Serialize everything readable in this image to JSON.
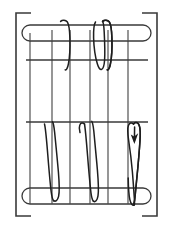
{
  "figure": {
    "width": 173,
    "height": 229,
    "background_color": "#ffffff",
    "line_color": "#3a3a3a",
    "thread_color": "#1e1e1e",
    "warp_color": "#4a4a4a"
  },
  "frame": {
    "left_bracket": {
      "name": "left-frame-bracket",
      "x": 16,
      "top_y": 13,
      "bottom_y": 216,
      "tick_length": 15
    },
    "right_bracket": {
      "name": "right-frame-bracket",
      "x": 157,
      "top_y": 13,
      "bottom_y": 216,
      "tick_length": 15
    }
  },
  "rails": [
    {
      "name": "top-rail",
      "label": "Top rail",
      "x": 22,
      "y": 25,
      "width": 129,
      "height": 16,
      "shape": "capsule"
    },
    {
      "name": "bottom-rail",
      "label": "Bottom rail",
      "x": 22,
      "y": 188,
      "width": 129,
      "height": 16,
      "shape": "capsule"
    }
  ],
  "weft_lines": [
    {
      "name": "upper-weft-line",
      "x1": 26,
      "x2": 148,
      "y": 60
    },
    {
      "name": "lower-weft-line",
      "x1": 26,
      "x2": 148,
      "y": 122
    }
  ],
  "warp_lines": [
    {
      "name": "warp-line-1",
      "x": 30,
      "y1": 33,
      "y2": 196
    },
    {
      "name": "warp-line-2",
      "x": 52,
      "y1": 30,
      "y2": 196
    },
    {
      "name": "warp-line-3",
      "x": 70,
      "y1": 30,
      "y2": 196
    },
    {
      "name": "warp-line-4",
      "x": 90,
      "y1": 30,
      "y2": 196
    },
    {
      "name": "warp-line-5",
      "x": 108,
      "y1": 30,
      "y2": 196
    },
    {
      "name": "warp-line-6",
      "x": 128,
      "y1": 30,
      "y2": 196
    }
  ],
  "threads": {
    "upper_group": {
      "name": "upper-stitch-group",
      "label": "Upper zigzag stitches",
      "paths": [
        "M 53.5 22 C 52.2 24 51.4 30 51.6 38 C 51.9 48 53.5 58 55.4 64 C 56.6 68 58.2 70 59.6 69.4 C 61.2 68.7 62.2 65.6 62.6 60 C 63.1 52 62.6 40 62.2 32 C 61.9 26 61.5 22.6 60.6 21.4",
        "M 60.6 21.4 C 62.4 19.6 65.6 19.8 67.2 21.8 C 68.8 23.8 69.6 29 69.9 38 C 70.2 48 69.6 58 68.4 64 C 67.6 68 66.4 70.4 65.2 69.8",
        "M 95.5 22 C 94.2 24 93.4 30 93.6 38 C 93.9 48 95.5 58 97.4 64 C 98.6 68 100.2 70 101.6 69.4 C 103.2 68.7 104.2 65.6 104.6 60 C 105.1 52 104.6 40 104.2 32 C 103.9 26 103.5 22.6 102.6 21.4",
        "M 102.6 21.4 C 104.4 19.6 107.6 19.8 109.2 21.8 C 110.8 23.8 111.6 29 111.9 38 C 112.2 48 111.6 58 110.4 64 C 109.6 68 108.4 70.4 107.2 69.8"
      ]
    },
    "lower_group": {
      "name": "lower-stitch-group",
      "label": "Lower zigzag stitches",
      "paths": [
        "M 44.5 124 C 42.6 122.4 40.6 122.8 39.6 125 C 38.6 127.2 38.8 131 39.8 134",
        "M 44.5 124 C 45.6 128 46.6 140 47.8 155 C 49 170 50.2 184 51.2 192 C 51.8 196.6 52.6 199.6 53.6 200.6",
        "M 53.6 200.6 C 55.4 202 57.6 200.6 58.6 196.4 C 59.6 192 59.4 184 58.4 172 C 57.2 158 55.6 142 54.6 132 C 54 126.4 53.4 123 52.6 121.8",
        "M 84.5 124 C 82.6 122.4 80.6 122.8 79.8 125 C 79 127 79.2 130 80 132.6",
        "M 84.5 124 C 85.4 129 86.4 141 87.6 156 C 88.8 171 90 185 91 193 C 91.6 197.4 92.4 200.2 93.4 201.2",
        "M 93.4 201.2 C 95.2 202.6 97.2 200.6 98 195.8 C 98.8 191 98.4 182 97.4 170 C 96.2 156 94.8 141 93.8 131 C 93.2 125.6 92.6 122.4 91.8 121.4",
        "M 133.5 124 C 131.6 122.2 129.4 122.8 128.4 125.4 C 127.4 128 127.6 133 128.6 140 C 129.8 148 131.4 160 132.4 172 C 133.4 184 134 194 134.4 199 C 134.6 202.2 134.8 204 134.2 205",
        "M 134.2 205 C 132.6 206 130.8 204 129.8 199.4 C 128.8 195 128.4 188 128.2 178",
        "M 133.5 124 C 134.8 122.2 137 122 138.4 123.8 C 139.8 125.6 140.4 129.4 140.2 136 C 139.9 145 138.8 157 137.8 168 C 136.8 179 135.8 189 135.2 195 C 134.8 199.4 134.4 202.4 133.8 203.6"
      ]
    }
  },
  "arrow": {
    "name": "thread-direction-arrow",
    "label": "Thread direction",
    "points": "134.4,144 130.8,134.4 134.2,136.6 138.2,133.2",
    "tip_x": 134.4,
    "tip_y": 144
  }
}
